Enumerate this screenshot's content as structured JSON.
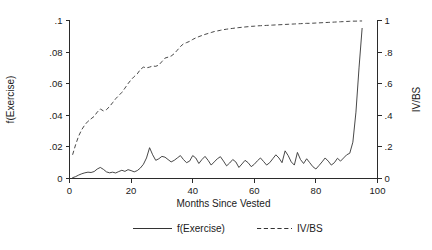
{
  "chart_data": {
    "type": "line",
    "title": "",
    "xlabel": "Months Since Vested",
    "ylabel": "f(Exercise)",
    "y2label": "IV/BS",
    "xlim": [
      0,
      100
    ],
    "ylim": [
      0,
      0.1
    ],
    "y2lim": [
      0,
      1.0
    ],
    "grid": false,
    "legend_position": "bottom",
    "xticks": [
      0,
      20,
      40,
      60,
      80,
      100
    ],
    "xticklabels": [
      "0",
      "20",
      "40",
      "60",
      "80",
      "100"
    ],
    "yticks": [
      0,
      0.02,
      0.04,
      0.06,
      0.08,
      0.1
    ],
    "yticklabels": [
      "0",
      ".02",
      ".04",
      ".06",
      ".08",
      ".1"
    ],
    "y2ticks": [
      0,
      0.2,
      0.4,
      0.6,
      0.8,
      1.0
    ],
    "y2ticklabels": [
      "0",
      ".2",
      ".4",
      ".6",
      ".8",
      "1"
    ],
    "series": [
      {
        "name": "f(Exercise)",
        "axis": "left",
        "style": "solid",
        "x": [
          1,
          2,
          3,
          4,
          5,
          6,
          7,
          8,
          9,
          10,
          11,
          12,
          13,
          14,
          15,
          16,
          17,
          18,
          19,
          20,
          21,
          22,
          23,
          24,
          25,
          26,
          27,
          28,
          29,
          30,
          31,
          32,
          33,
          34,
          35,
          36,
          37,
          38,
          39,
          40,
          41,
          42,
          43,
          44,
          45,
          46,
          47,
          48,
          49,
          50,
          51,
          52,
          53,
          54,
          55,
          56,
          57,
          58,
          59,
          60,
          61,
          62,
          63,
          64,
          65,
          66,
          67,
          68,
          69,
          70,
          71,
          72,
          73,
          74,
          75,
          76,
          77,
          78,
          79,
          80,
          81,
          82,
          83,
          84,
          85,
          86,
          87,
          88,
          89,
          90,
          91,
          92,
          93,
          94,
          95
        ],
        "values": [
          0.0005,
          0.0012,
          0.0022,
          0.003,
          0.0036,
          0.004,
          0.0038,
          0.0044,
          0.006,
          0.007,
          0.0058,
          0.0042,
          0.0036,
          0.004,
          0.0035,
          0.0044,
          0.0052,
          0.0045,
          0.0056,
          0.005,
          0.0042,
          0.005,
          0.0066,
          0.009,
          0.013,
          0.0195,
          0.015,
          0.0115,
          0.0125,
          0.014,
          0.0135,
          0.012,
          0.0105,
          0.0115,
          0.013,
          0.0145,
          0.012,
          0.01,
          0.011,
          0.0145,
          0.013,
          0.0095,
          0.012,
          0.014,
          0.0115,
          0.0085,
          0.0105,
          0.0125,
          0.0138,
          0.011,
          0.008,
          0.0098,
          0.012,
          0.0105,
          0.007,
          0.0092,
          0.0115,
          0.01,
          0.0075,
          0.009,
          0.0112,
          0.013,
          0.0108,
          0.0085,
          0.01,
          0.0125,
          0.015,
          0.013,
          0.01,
          0.0175,
          0.0145,
          0.0105,
          0.0085,
          0.0165,
          0.012,
          0.0095,
          0.0125,
          0.01,
          0.0075,
          0.006,
          0.0082,
          0.0105,
          0.013,
          0.011,
          0.0085,
          0.01,
          0.0128,
          0.011,
          0.013,
          0.015,
          0.016,
          0.023,
          0.042,
          0.07,
          0.095
        ]
      },
      {
        "name": "IV/BS",
        "axis": "right",
        "style": "dashed",
        "x": [
          1,
          2,
          3,
          4,
          5,
          6,
          7,
          8,
          9,
          10,
          11,
          12,
          13,
          14,
          15,
          16,
          17,
          18,
          19,
          20,
          21,
          22,
          23,
          24,
          25,
          26,
          27,
          28,
          29,
          30,
          31,
          32,
          33,
          34,
          35,
          36,
          37,
          38,
          39,
          40,
          41,
          42,
          43,
          44,
          45,
          46,
          47,
          48,
          49,
          50,
          51,
          52,
          53,
          54,
          55,
          56,
          57,
          58,
          59,
          60,
          61,
          62,
          63,
          64,
          65,
          66,
          67,
          68,
          69,
          70,
          71,
          72,
          73,
          74,
          75,
          76,
          77,
          78,
          79,
          80,
          81,
          82,
          83,
          84,
          85,
          86,
          87,
          88,
          89,
          90,
          91,
          92,
          93,
          94,
          95
        ],
        "values": [
          0.15,
          0.215,
          0.27,
          0.31,
          0.34,
          0.362,
          0.378,
          0.393,
          0.42,
          0.44,
          0.428,
          0.436,
          0.455,
          0.48,
          0.505,
          0.525,
          0.545,
          0.572,
          0.6,
          0.625,
          0.645,
          0.662,
          0.69,
          0.705,
          0.7,
          0.705,
          0.712,
          0.71,
          0.718,
          0.74,
          0.762,
          0.768,
          0.775,
          0.79,
          0.812,
          0.835,
          0.852,
          0.86,
          0.868,
          0.88,
          0.89,
          0.898,
          0.905,
          0.912,
          0.918,
          0.924,
          0.93,
          0.934,
          0.938,
          0.942,
          0.945,
          0.948,
          0.95,
          0.953,
          0.955,
          0.957,
          0.959,
          0.961,
          0.963,
          0.964,
          0.966,
          0.967,
          0.968,
          0.969,
          0.97,
          0.971,
          0.972,
          0.973,
          0.974,
          0.975,
          0.976,
          0.977,
          0.978,
          0.979,
          0.98,
          0.981,
          0.982,
          0.982,
          0.983,
          0.984,
          0.985,
          0.986,
          0.987,
          0.988,
          0.989,
          0.99,
          0.991,
          0.992,
          0.993,
          0.994,
          0.995,
          0.996,
          0.996,
          0.997,
          0.997
        ]
      }
    ]
  },
  "legend": {
    "items": [
      {
        "label": "f(Exercise)",
        "style": "solid"
      },
      {
        "label": "IV/BS",
        "style": "dashed"
      }
    ]
  },
  "colors": {
    "line": "#333333",
    "axis": "#2b2b2b",
    "background": "#ffffff"
  }
}
